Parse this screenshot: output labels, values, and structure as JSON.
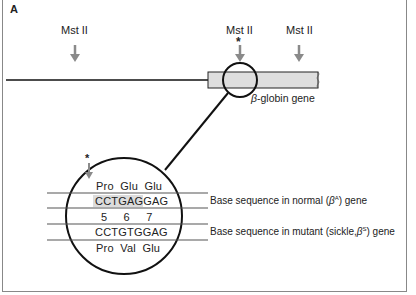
{
  "panel_label": "A",
  "restriction_sites": [
    {
      "label": "Mst II",
      "marked": false
    },
    {
      "label": "Mst II",
      "marked": true,
      "marker": "*"
    },
    {
      "label": "Mst II",
      "marked": false
    }
  ],
  "gene_label": "-globin gene",
  "gene_symbol": "β",
  "detail": {
    "normal_aa": "Pro  Glu  Glu",
    "normal_seq_highlight": "CCTGAGG",
    "normal_seq_rest": "AG",
    "codon_numbers": "5     6     7",
    "mutant_seq": "CCTGTGGAG",
    "mutant_aa": "Pro  Val  Glu",
    "cut_marker": "*"
  },
  "captions": {
    "normal_prefix": "Base sequence in normal (",
    "normal_sym": "β",
    "normal_sup": "A",
    "normal_suffix": ") gene",
    "mutant_prefix": "Base sequence in mutant (sickle,",
    "mutant_sym": "β",
    "mutant_sup": "S",
    "mutant_suffix": ") gene"
  },
  "colors": {
    "arrow": "#8a8a8a",
    "gene_fill": "#dedede",
    "line": "#111111"
  }
}
